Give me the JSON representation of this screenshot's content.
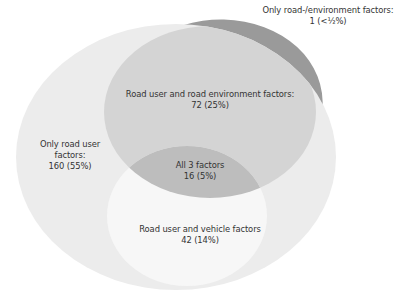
{
  "diagram": {
    "type": "venn",
    "sets": [
      "Road user factors",
      "Road environment factors",
      "Vehicle factors"
    ],
    "colors": {
      "background": "#ffffff",
      "road_user_only": "#ececec",
      "road_env_only": "#9a9a9a",
      "road_user_and_env": "#d4d4d4",
      "road_user_and_vehicle": "#f7f7f7",
      "all_three": "#bdbdbd",
      "text": "#333333"
    },
    "regions": {
      "road_env_only": {
        "title": "Only road-/environment factors:",
        "value": "1 (<½%)"
      },
      "road_user_and_env": {
        "title": "Road user and road environment factors:",
        "value": "72 (25%)"
      },
      "road_user_only": {
        "title_line1": "Only road user",
        "title_line2": "factors:",
        "value": "160 (55%)"
      },
      "all_three": {
        "title": "All 3 factors",
        "value": "16 (5%)"
      },
      "road_user_and_vehicle": {
        "title": "Road user and vehicle factors",
        "value": "42 (14%)"
      }
    }
  }
}
